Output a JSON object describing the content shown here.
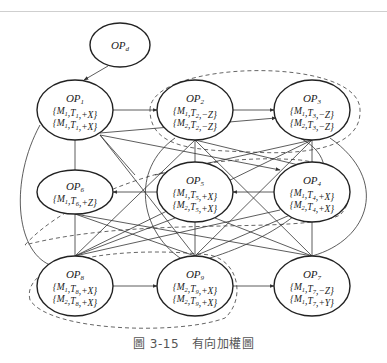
{
  "figure": {
    "caption": "圖 3-15　有向加權圖",
    "line_color": "#333333",
    "dashed_color": "#555555"
  },
  "nodes": [
    {
      "id": "OPd",
      "name": "OP",
      "sub": "d",
      "lines": [],
      "cx": 120,
      "cy": 45,
      "rx": 30,
      "ry": 22
    },
    {
      "id": "OP1",
      "name": "OP",
      "sub": "1",
      "lines": [
        "{M1,T1,+X}",
        "{M1,T1,+X}"
      ],
      "cx": 75,
      "cy": 110,
      "rx": 38,
      "ry": 30
    },
    {
      "id": "OP2",
      "name": "OP",
      "sub": "2",
      "lines": [
        "{M1,T2,−Z}",
        "{M2,T2,−Z}"
      ],
      "cx": 195,
      "cy": 110,
      "rx": 38,
      "ry": 30
    },
    {
      "id": "OP3",
      "name": "OP",
      "sub": "3",
      "lines": [
        "{M1,T3,−Z}",
        "{M2,T3,−Z}"
      ],
      "cx": 312,
      "cy": 110,
      "rx": 38,
      "ry": 30
    },
    {
      "id": "OP6",
      "name": "OP",
      "sub": "6",
      "lines": [
        "{M1,T6,+Z}"
      ],
      "cx": 75,
      "cy": 192,
      "rx": 38,
      "ry": 22
    },
    {
      "id": "OP5",
      "name": "OP",
      "sub": "5",
      "lines": [
        "{M1,T5,+X}",
        "{M2,T5,+X}"
      ],
      "cx": 195,
      "cy": 192,
      "rx": 38,
      "ry": 30
    },
    {
      "id": "OP4",
      "name": "OP",
      "sub": "4",
      "lines": [
        "{M1,T4,+X}",
        "{M2,T4,+X}"
      ],
      "cx": 312,
      "cy": 192,
      "rx": 38,
      "ry": 30
    },
    {
      "id": "OP8",
      "name": "OP",
      "sub": "8",
      "lines": [
        "{M1,T8,+X}",
        "{M2,T8,+X}"
      ],
      "cx": 75,
      "cy": 286,
      "rx": 38,
      "ry": 30
    },
    {
      "id": "OP9",
      "name": "OP",
      "sub": "9",
      "lines": [
        "{M2,T9,+X}",
        "{M2,T9,+X}"
      ],
      "cx": 195,
      "cy": 286,
      "rx": 38,
      "ry": 30
    },
    {
      "id": "OP7",
      "name": "OP",
      "sub": "7",
      "lines": [
        "{M1,T7,−Z}",
        "{M1,T7,+Y}"
      ],
      "cx": 312,
      "cy": 286,
      "rx": 38,
      "ry": 30
    }
  ],
  "edges": [
    {
      "from": "OPd",
      "to": "OP1",
      "directed": true
    },
    {
      "from": "OP1",
      "to": "OP2",
      "directed": true
    },
    {
      "from": "OP2",
      "to": "OP3",
      "directed": true
    },
    {
      "from": "OP4",
      "to": "OP5",
      "directed": true
    },
    {
      "from": "OP5",
      "to": "OP6",
      "directed": true
    },
    {
      "from": "OP8",
      "to": "OP9",
      "directed": true
    },
    {
      "from": "OP9",
      "to": "OP7",
      "directed": true
    },
    {
      "from": "OP1",
      "to": "OP6",
      "directed": false
    },
    {
      "from": "OP1",
      "to": "OP3",
      "directed": true
    },
    {
      "from": "OP1",
      "to": "OP4",
      "directed": true
    },
    {
      "from": "OP1",
      "to": "OP9",
      "directed": false
    },
    {
      "from": "OP2",
      "to": "OP5",
      "directed": false
    },
    {
      "from": "OP3",
      "to": "OP4",
      "directed": false
    },
    {
      "from": "OP6",
      "to": "OP8",
      "directed": false
    },
    {
      "from": "OP5",
      "to": "OP9",
      "directed": false
    },
    {
      "from": "OP4",
      "to": "OP7",
      "directed": false
    }
  ],
  "clusters": [
    {
      "name": "dashed-group-top",
      "members": [
        "OP2",
        "OP3"
      ]
    },
    {
      "name": "dashed-group-middle",
      "members": [
        "OP5",
        "OP4"
      ]
    },
    {
      "name": "dashed-group-bottom",
      "members": [
        "OP8",
        "OP9"
      ]
    }
  ]
}
